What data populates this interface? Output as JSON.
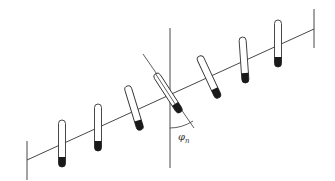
{
  "figure": {
    "angle_label": {
      "symbol": "φ",
      "subscript": "n"
    },
    "colors": {
      "stroke": "#333333",
      "fill_liquid": "#1a1a1a",
      "background": "#ffffff"
    },
    "tube_count": 7
  }
}
